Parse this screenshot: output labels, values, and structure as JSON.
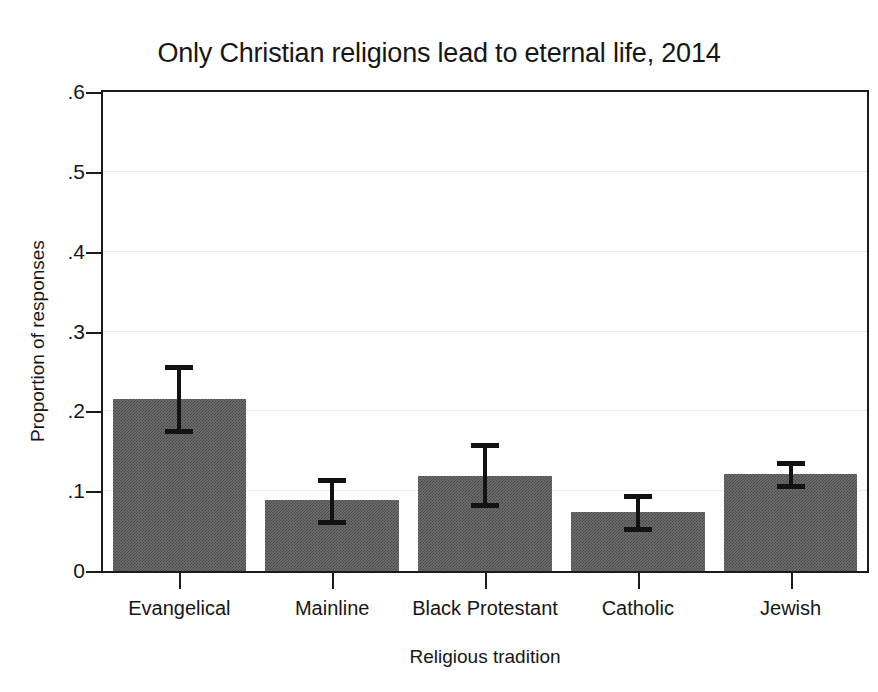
{
  "chart_data": {
    "type": "bar",
    "title": "Only Christian religions lead to eternal life, 2014",
    "xlabel": "Religious tradition",
    "ylabel": "Proportion of responses",
    "categories": [
      "Evangelical",
      "Mainline",
      "Black Protestant",
      "Catholic",
      "Jewish"
    ],
    "values": [
      0.215,
      0.089,
      0.119,
      0.074,
      0.121
    ],
    "errors_low": [
      0.174,
      0.06,
      0.081,
      0.052,
      0.105
    ],
    "errors_high": [
      0.256,
      0.114,
      0.158,
      0.094,
      0.135
    ],
    "series": [
      {
        "name": "Proportion of responses",
        "values": [
          0.215,
          0.089,
          0.119,
          0.074,
          0.121
        ]
      }
    ],
    "ylim": [
      0,
      0.6
    ],
    "yticks": [
      0,
      0.1,
      0.2,
      0.3,
      0.4,
      0.5,
      0.6
    ],
    "ytick_labels": [
      "0",
      ".1",
      ".2",
      ".3",
      ".4",
      ".5",
      ".6"
    ],
    "grid": true,
    "grid_axis": "y",
    "legend": false,
    "bar_color": "#6e6e6e",
    "error_bar_color": "#121212",
    "axis_color": "#1b1b1b",
    "grid_color": "#ededed",
    "background_color": "#ffffff"
  }
}
